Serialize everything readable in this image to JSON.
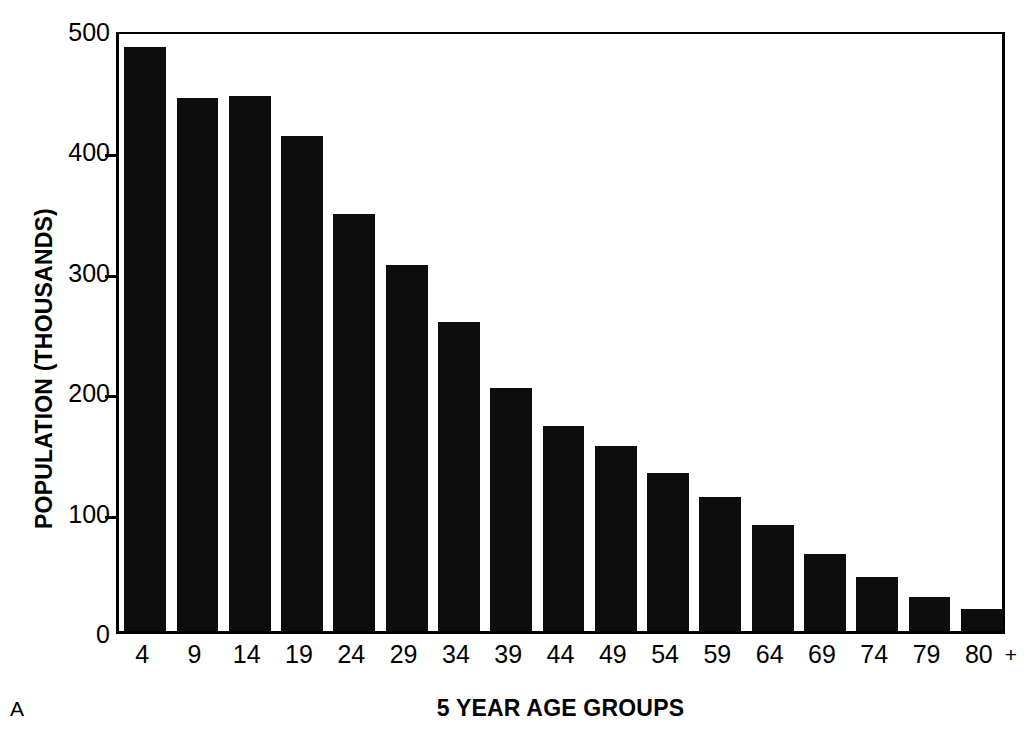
{
  "chart_data": {
    "type": "bar",
    "title": "",
    "panel_label": "A",
    "xlabel": "5 YEAR AGE GROUPS",
    "ylabel": "POPULATION (THOUSANDS)",
    "categories": [
      "4",
      "9",
      "14",
      "19",
      "24",
      "29",
      "34",
      "39",
      "44",
      "49",
      "54",
      "59",
      "64",
      "69",
      "74",
      "79",
      "80"
    ],
    "last_category_suffix": "+",
    "values": [
      485,
      443,
      444,
      411,
      346,
      304,
      257,
      202,
      170,
      154,
      131,
      111,
      88,
      64,
      45,
      28,
      18
    ],
    "ylim": [
      0,
      500
    ],
    "yticks": [
      0,
      100,
      200,
      300,
      400,
      500
    ],
    "yticklabels": [
      "0",
      "100",
      "200",
      "300",
      "400",
      "500"
    ],
    "grid": false,
    "legend": false,
    "bar_color": "#0d0d0d",
    "axis_color": "#000000",
    "background_color": "#ffffff"
  }
}
